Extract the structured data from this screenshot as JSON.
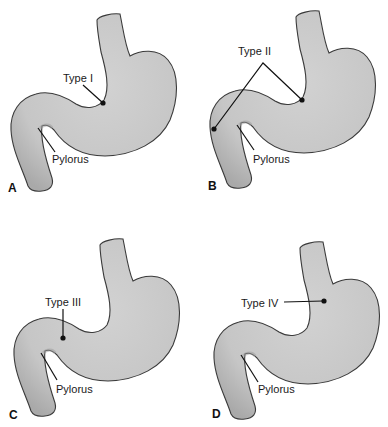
{
  "figure": {
    "colors": {
      "organ_fill": "#c9c9c9",
      "organ_shadow": "#a8a8a8",
      "outline": "#3a3a3a",
      "text": "#1a1a1a"
    },
    "panels": [
      {
        "letter": "A",
        "annotation": "Type I",
        "pylorus_label": "Pylorus"
      },
      {
        "letter": "B",
        "annotation": "Type II",
        "pylorus_label": "Pylorus"
      },
      {
        "letter": "C",
        "annotation": "Type III",
        "pylorus_label": "Pylorus"
      },
      {
        "letter": "D",
        "annotation": "Type IV",
        "pylorus_label": "Pylorus"
      }
    ]
  }
}
